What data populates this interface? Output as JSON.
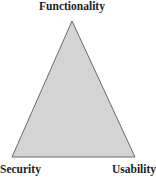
{
  "diagram": {
    "type": "triangle",
    "vertices": {
      "top": "Functionality",
      "bottom_left": "Security",
      "bottom_right": "Usability"
    },
    "fill_color": "#d4d4d4",
    "stroke_color": "#6a6a6a"
  }
}
